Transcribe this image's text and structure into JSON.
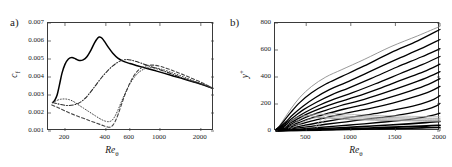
{
  "figure": {
    "panels": [
      {
        "label": "a)",
        "xlabel": "Re",
        "xlabel_sub": "θ",
        "ylabel": "c",
        "ylabel_sub": "f"
      },
      {
        "label": "b)",
        "xlabel": "Re",
        "xlabel_sub": "θ",
        "ylabel": "y",
        "ylabel_sup": "+"
      }
    ]
  },
  "chart_data": [
    {
      "type": "line",
      "panel": "a)",
      "title": "",
      "xlabel": "Re_theta",
      "ylabel": "c_f",
      "xscale": "log",
      "yscale": "linear",
      "xlim": [
        150,
        2500
      ],
      "ylim": [
        0.001,
        0.007
      ],
      "xticks": [
        200,
        400,
        600,
        1000,
        2000
      ],
      "xticklabels": [
        "200",
        "400",
        "600",
        "1000",
        "2000"
      ],
      "yticks": [
        0.001,
        0.002,
        0.003,
        0.004,
        0.005,
        0.006,
        0.007
      ],
      "yticklabels": [
        "0.001",
        "0.002",
        "0.003",
        "0.004",
        "0.005",
        "0.006",
        "0.007"
      ],
      "grid": false,
      "legend": "none",
      "series": [
        {
          "name": "solid",
          "style": "solid",
          "color": "#000000",
          "width": 1.5,
          "x": [
            162,
            168,
            175,
            182,
            190,
            200,
            212,
            225,
            240,
            255,
            272,
            290,
            310,
            330,
            350,
            360,
            375,
            395,
            420,
            450,
            490,
            540,
            600,
            680,
            780,
            900,
            1050,
            1250,
            1500,
            1800,
            2150,
            2450
          ],
          "y": [
            0.00258,
            0.0027,
            0.003,
            0.00355,
            0.0042,
            0.0047,
            0.005,
            0.00508,
            0.005,
            0.00492,
            0.00495,
            0.00512,
            0.00548,
            0.0059,
            0.00618,
            0.00622,
            0.00615,
            0.00592,
            0.00562,
            0.00532,
            0.00505,
            0.00487,
            0.00475,
            0.00463,
            0.0045,
            0.00437,
            0.00423,
            0.00406,
            0.00389,
            0.00371,
            0.00353,
            0.00337
          ]
        },
        {
          "name": "dash-dot",
          "style": "dashdot",
          "color": "#2b2b2b",
          "width": 1.1,
          "x": [
            162,
            175,
            195,
            215,
            240,
            262,
            282,
            300,
            320,
            345,
            375,
            410,
            450,
            490,
            530,
            570,
            610,
            660,
            720,
            800,
            900,
            1050,
            1250,
            1500,
            1800,
            2150,
            2450
          ],
          "y": [
            0.00258,
            0.00252,
            0.00244,
            0.00242,
            0.00248,
            0.00262,
            0.00282,
            0.00305,
            0.00332,
            0.00365,
            0.004,
            0.00433,
            0.00462,
            0.00482,
            0.00493,
            0.00497,
            0.00494,
            0.00487,
            0.00478,
            0.00466,
            0.00452,
            0.00435,
            0.00414,
            0.00392,
            0.00372,
            0.00354,
            0.00337
          ]
        },
        {
          "name": "dotted",
          "style": "dotted",
          "color": "#3a3a3a",
          "width": 1.0,
          "x": [
            162,
            172,
            185,
            200,
            215,
            228,
            240,
            255,
            275,
            295,
            315,
            335,
            355,
            375,
            395,
            412,
            428,
            445,
            465,
            490,
            520,
            555,
            600,
            650,
            710,
            790,
            890,
            1020,
            1200,
            1450,
            1750,
            2100,
            2450
          ],
          "y": [
            0.00258,
            0.00268,
            0.00276,
            0.00278,
            0.00274,
            0.00266,
            0.00256,
            0.00242,
            0.00226,
            0.00211,
            0.00197,
            0.00184,
            0.00172,
            0.00162,
            0.00155,
            0.00152,
            0.00153,
            0.0016,
            0.0018,
            0.00215,
            0.00262,
            0.0031,
            0.0036,
            0.004,
            0.0043,
            0.00448,
            0.00452,
            0.00444,
            0.00427,
            0.00404,
            0.0038,
            0.00358,
            0.00337
          ]
        },
        {
          "name": "dashed",
          "style": "dashed",
          "color": "#444444",
          "width": 1.1,
          "x": [
            160,
            180,
            205,
            235,
            270,
            305,
            340,
            370,
            395,
            412,
            425,
            438,
            452,
            470,
            492,
            520,
            555,
            600,
            650,
            710,
            790,
            890,
            1020,
            1200,
            1450,
            1750,
            2100,
            2450
          ],
          "y": [
            0.00245,
            0.00228,
            0.00208,
            0.00189,
            0.00172,
            0.00157,
            0.00144,
            0.00134,
            0.00126,
            0.00122,
            0.00121,
            0.00124,
            0.00134,
            0.00155,
            0.00192,
            0.00245,
            0.00305,
            0.00365,
            0.00412,
            0.00445,
            0.00462,
            0.00466,
            0.00458,
            0.0044,
            0.00416,
            0.0039,
            0.00364,
            0.00337
          ]
        }
      ]
    },
    {
      "type": "line",
      "panel": "b)",
      "title": "",
      "xlabel": "Re_theta",
      "ylabel": "y_plus",
      "xscale": "linear",
      "yscale": "linear",
      "xlim": [
        150,
        2000
      ],
      "ylim": [
        0,
        800
      ],
      "xticks": [
        500,
        1000,
        1500,
        2000
      ],
      "xticklabels": [
        "500",
        "1000",
        "1500",
        "2000"
      ],
      "yticks": [
        0,
        200,
        400,
        600,
        800
      ],
      "yticklabels": [
        "0",
        "200",
        "400",
        "600",
        "800"
      ],
      "grid": false,
      "legend": "none",
      "comment": "fan of wall-normal grid/streamline traces rising from dense bundle near origin",
      "series": [
        {
          "name": "t1",
          "style": "solid",
          "color": "#8c8c8c",
          "width": 0.9,
          "x": [
            165,
            200,
            250,
            330,
            430,
            560,
            720,
            900,
            1150,
            1450,
            1750,
            2000
          ],
          "y": [
            16,
            40,
            88,
            165,
            250,
            330,
            400,
            455,
            530,
            625,
            705,
            775
          ]
        },
        {
          "name": "t2",
          "style": "solid",
          "color": "#000000",
          "width": 1.3,
          "x": [
            165,
            200,
            250,
            330,
            430,
            560,
            720,
            900,
            1150,
            1450,
            1750,
            2000
          ],
          "y": [
            14,
            34,
            74,
            140,
            212,
            283,
            348,
            404,
            482,
            580,
            668,
            752
          ]
        },
        {
          "name": "t3",
          "style": "solid",
          "color": "#000000",
          "width": 1.3,
          "x": [
            165,
            210,
            270,
            350,
            460,
            600,
            760,
            950,
            1200,
            1500,
            1780,
            2000
          ],
          "y": [
            12,
            32,
            66,
            120,
            182,
            246,
            306,
            360,
            436,
            527,
            608,
            678
          ]
        },
        {
          "name": "t4",
          "style": "solid",
          "color": "#000000",
          "width": 1.3,
          "x": [
            165,
            210,
            270,
            360,
            470,
            620,
            790,
            980,
            1230,
            1520,
            1790,
            2000
          ],
          "y": [
            11,
            28,
            58,
            104,
            158,
            215,
            270,
            320,
            390,
            474,
            548,
            610
          ]
        },
        {
          "name": "t5",
          "style": "solid",
          "color": "#000000",
          "width": 1.3,
          "x": [
            165,
            215,
            280,
            370,
            490,
            640,
            820,
            1020,
            1270,
            1550,
            1800,
            2000
          ],
          "y": [
            10,
            25,
            51,
            91,
            139,
            189,
            238,
            284,
            348,
            424,
            492,
            552
          ]
        },
        {
          "name": "t6",
          "style": "solid",
          "color": "#000000",
          "width": 1.3,
          "x": [
            165,
            215,
            285,
            380,
            500,
            660,
            850,
            1060,
            1310,
            1580,
            1820,
            2000
          ],
          "y": [
            9,
            23,
            46,
            81,
            123,
            168,
            212,
            254,
            312,
            380,
            440,
            495
          ]
        },
        {
          "name": "t7",
          "style": "solid",
          "color": "#000000",
          "width": 1.3,
          "x": [
            165,
            220,
            295,
            395,
            520,
            690,
            880,
            1100,
            1350,
            1620,
            1840,
            2000
          ],
          "y": [
            8,
            20,
            40,
            71,
            108,
            147,
            187,
            225,
            277,
            338,
            392,
            440
          ]
        },
        {
          "name": "t8",
          "style": "solid",
          "color": "#000000",
          "width": 1.3,
          "x": [
            165,
            225,
            305,
            415,
            550,
            730,
            930,
            1160,
            1410,
            1670,
            1870,
            2000
          ],
          "y": [
            7,
            18,
            35,
            62,
            94,
            128,
            163,
            197,
            243,
            297,
            345,
            388
          ]
        },
        {
          "name": "t9",
          "style": "solid",
          "color": "#000000",
          "width": 1.3,
          "x": [
            165,
            230,
            320,
            440,
            590,
            780,
            990,
            1220,
            1470,
            1710,
            1890,
            2000
          ],
          "y": [
            6,
            15,
            30,
            52,
            79,
            108,
            138,
            167,
            206,
            252,
            293,
            330
          ]
        },
        {
          "name": "t10",
          "style": "solid",
          "color": "#000000",
          "width": 1.3,
          "x": [
            165,
            240,
            345,
            480,
            650,
            860,
            1080,
            1320,
            1560,
            1790,
            1930,
            2000
          ],
          "y": [
            5,
            12,
            24,
            42,
            63,
            86,
            110,
            134,
            165,
            201,
            234,
            262
          ]
        },
        {
          "name": "t11",
          "style": "solid",
          "color": "#000000",
          "width": 1.3,
          "x": [
            165,
            250,
            370,
            530,
            720,
            950,
            1180,
            1420,
            1650,
            1850,
            1960,
            2000
          ],
          "y": [
            4,
            10,
            19,
            33,
            50,
            68,
            88,
            107,
            131,
            160,
            186,
            205
          ]
        },
        {
          "name": "t12",
          "style": "solid",
          "color": "#000000",
          "width": 1.3,
          "x": [
            165,
            270,
            420,
            610,
            830,
            1070,
            1310,
            1540,
            1740,
            1900,
            2000
          ],
          "y": [
            3,
            7,
            14,
            24,
            36,
            49,
            63,
            77,
            94,
            114,
            132
          ]
        },
        {
          "name": "t13",
          "style": "solid",
          "color": "#000000",
          "width": 1.6,
          "x": [
            165,
            300,
            480,
            700,
            940,
            1190,
            1430,
            1650,
            1840,
            2000
          ],
          "y": [
            2,
            6,
            11,
            18,
            26,
            35,
            44,
            53,
            62,
            70
          ]
        },
        {
          "name": "t14",
          "style": "solid",
          "color": "#000000",
          "width": 1.8,
          "x": [
            165,
            350,
            580,
            840,
            1110,
            1380,
            1630,
            1850,
            2000
          ],
          "y": [
            2,
            5,
            9,
            14,
            20,
            26,
            32,
            37,
            42
          ]
        },
        {
          "name": "t15",
          "style": "solid",
          "color": "#000000",
          "width": 1.6,
          "x": [
            165,
            400,
            680,
            980,
            1270,
            1550,
            1800,
            2000
          ],
          "y": [
            1,
            4,
            7,
            11,
            15,
            19,
            23,
            26
          ]
        },
        {
          "name": "g1",
          "style": "solid",
          "color": "#9a9a9a",
          "width": 0.8,
          "x": [
            300,
            340,
            390,
            450,
            510,
            570,
            620,
            660,
            700,
            760,
            840,
            950,
            1100,
            1300,
            1550,
            1800,
            2000
          ],
          "y": [
            22,
            42,
            68,
            94,
            112,
            122,
            126,
            125,
            122,
            118,
            114,
            110,
            106,
            102,
            98,
            95,
            93
          ]
        },
        {
          "name": "g2",
          "style": "solid",
          "color": "#9a9a9a",
          "width": 0.8,
          "x": [
            330,
            380,
            440,
            500,
            560,
            610,
            660,
            710,
            770,
            850,
            960,
            1110,
            1320,
            1560,
            1800,
            2000
          ],
          "y": [
            18,
            36,
            58,
            78,
            92,
            99,
            101,
            99,
            95,
            90,
            86,
            82,
            79,
            76,
            74,
            72
          ]
        },
        {
          "name": "g3",
          "style": "solid",
          "color": "#9a9a9a",
          "width": 0.8,
          "x": [
            260,
            290,
            330,
            380,
            430,
            480,
            530,
            580,
            650,
            750,
            880,
            1050,
            1280,
            1550,
            1800,
            2000
          ],
          "y": [
            26,
            48,
            72,
            94,
            108,
            114,
            114,
            110,
            104,
            98,
            93,
            88,
            84,
            81,
            78,
            76
          ]
        },
        {
          "name": "g4",
          "style": "solid",
          "color": "#b0b0b0",
          "width": 0.8,
          "x": [
            600,
            640,
            680,
            720,
            760,
            810,
            880,
            980,
            1120,
            1320,
            1560,
            1800,
            2000
          ],
          "y": [
            30,
            64,
            96,
            118,
            128,
            130,
            128,
            124,
            119,
            114,
            110,
            107,
            105
          ]
        },
        {
          "name": "g5",
          "style": "solid",
          "color": "#b0b0b0",
          "width": 0.8,
          "x": [
            620,
            660,
            700,
            740,
            790,
            860,
            950,
            1090,
            1290,
            1540,
            1790,
            2000
          ],
          "y": [
            24,
            52,
            78,
            96,
            104,
            104,
            101,
            97,
            93,
            90,
            87,
            85
          ]
        }
      ]
    }
  ]
}
